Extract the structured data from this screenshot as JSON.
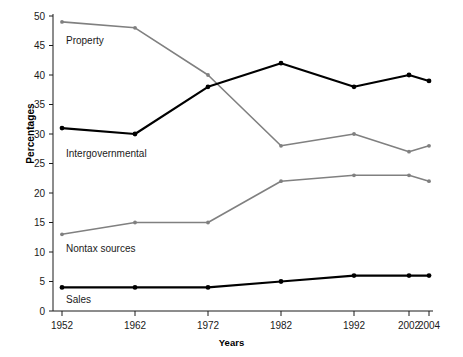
{
  "chart_data": {
    "type": "line",
    "title": "",
    "xlabel": "Years",
    "ylabel": "Percentages",
    "x": [
      1952,
      1962,
      1972,
      1982,
      1992,
      2002,
      2004
    ],
    "xtick_labels": [
      "1952",
      "1962",
      "1972",
      "1982",
      "1992",
      "2002",
      "2004"
    ],
    "ylim": [
      0,
      50
    ],
    "xlim": [
      1952,
      2004
    ],
    "ytick_values": [
      0,
      5,
      10,
      15,
      20,
      25,
      30,
      35,
      40,
      45,
      50
    ],
    "ytick_labels": [
      "0",
      "5",
      "10",
      "15",
      "20",
      "25",
      "30",
      "35",
      "40",
      "45",
      "50"
    ],
    "grid": false,
    "legend_position": "inline-labels",
    "series": [
      {
        "name": "Property",
        "color": "#808080",
        "label_text": "Property",
        "values": [
          49,
          48,
          40,
          28,
          30,
          27,
          28
        ]
      },
      {
        "name": "Intergovernmental",
        "color": "#000000",
        "label_text": "Intergovernmental",
        "values": [
          31,
          30,
          38,
          42,
          38,
          40,
          39
        ]
      },
      {
        "name": "Nontax sources",
        "color": "#808080",
        "label_text": "Nontax sources",
        "values": [
          13,
          15,
          15,
          22,
          23,
          23,
          22
        ]
      },
      {
        "name": "Sales",
        "color": "#000000",
        "label_text": "Sales",
        "values": [
          4,
          4,
          4,
          5,
          6,
          6,
          6
        ]
      }
    ]
  }
}
